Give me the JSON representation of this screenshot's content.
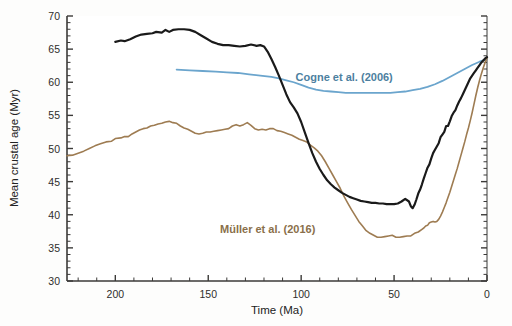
{
  "chart_data": {
    "type": "line",
    "title": "",
    "xlabel": "Time (Ma)",
    "ylabel": "Mean crustal age (Myr)",
    "xlim": [
      226,
      0
    ],
    "ylim": [
      30,
      70
    ],
    "x_reversed": true,
    "grid": false,
    "legend_position": "inline-annotations",
    "xticks": [
      200,
      150,
      100,
      50,
      0
    ],
    "xtick_labels": [
      "200",
      "150",
      "100",
      "50",
      "0"
    ],
    "x_minor_interval": 10,
    "yticks": [
      30,
      35,
      40,
      45,
      50,
      55,
      60,
      65,
      70
    ],
    "ytick_labels": [
      "30",
      "35",
      "40",
      "45",
      "50",
      "55",
      "60",
      "65",
      "70"
    ],
    "y_minor_interval": 1,
    "series": [
      {
        "name": "Seton et al. (2012)",
        "color": "#1a1a1a",
        "width": 2.2,
        "label_color": "#111111",
        "label_x": 148,
        "label_y": 353,
        "points": [
          [
            200,
            66.1
          ],
          [
            197,
            66.3
          ],
          [
            195,
            66.2
          ],
          [
            192,
            66.5
          ],
          [
            189,
            66.9
          ],
          [
            186,
            67.2
          ],
          [
            183,
            67.3
          ],
          [
            180,
            67.4
          ],
          [
            178,
            67.6
          ],
          [
            175,
            67.5
          ],
          [
            173,
            67.9
          ],
          [
            171,
            67.6
          ],
          [
            169,
            67.9
          ],
          [
            166,
            68.0
          ],
          [
            163,
            68.0
          ],
          [
            160,
            67.9
          ],
          [
            157,
            67.6
          ],
          [
            154,
            67.1
          ],
          [
            151,
            66.6
          ],
          [
            148,
            66.1
          ],
          [
            145,
            65.8
          ],
          [
            142,
            65.6
          ],
          [
            139,
            65.6
          ],
          [
            136,
            65.5
          ],
          [
            133,
            65.4
          ],
          [
            130,
            65.5
          ],
          [
            127,
            65.7
          ],
          [
            124,
            65.5
          ],
          [
            122,
            65.6
          ],
          [
            120,
            65.4
          ],
          [
            118,
            64.6
          ],
          [
            116,
            63.5
          ],
          [
            114,
            62.3
          ],
          [
            112,
            61.0
          ],
          [
            110,
            59.6
          ],
          [
            108,
            58.2
          ],
          [
            106,
            57.0
          ],
          [
            104,
            56.2
          ],
          [
            102,
            55.3
          ],
          [
            100,
            54.0
          ],
          [
            98,
            52.4
          ],
          [
            96,
            50.8
          ],
          [
            94,
            49.3
          ],
          [
            92,
            48.0
          ],
          [
            90,
            46.9
          ],
          [
            88,
            46.0
          ],
          [
            86,
            45.2
          ],
          [
            84,
            44.6
          ],
          [
            82,
            44.1
          ],
          [
            80,
            43.7
          ],
          [
            78,
            43.3
          ],
          [
            76,
            43.0
          ],
          [
            74,
            42.7
          ],
          [
            72,
            42.5
          ],
          [
            70,
            42.3
          ],
          [
            68,
            42.1
          ],
          [
            66,
            42.0
          ],
          [
            64,
            41.9
          ],
          [
            62,
            41.8
          ],
          [
            60,
            41.8
          ],
          [
            58,
            41.7
          ],
          [
            56,
            41.7
          ],
          [
            54,
            41.6
          ],
          [
            52,
            41.6
          ],
          [
            50,
            41.6
          ],
          [
            48,
            41.7
          ],
          [
            46,
            42.0
          ],
          [
            44,
            42.4
          ],
          [
            42,
            42.0
          ],
          [
            41,
            41.3
          ],
          [
            40,
            41.0
          ],
          [
            39,
            41.5
          ],
          [
            38,
            42.3
          ],
          [
            37,
            43.2
          ],
          [
            36,
            43.8
          ],
          [
            35,
            44.6
          ],
          [
            34,
            45.5
          ],
          [
            33,
            46.3
          ],
          [
            32,
            47.1
          ],
          [
            31,
            47.6
          ],
          [
            30,
            48.5
          ],
          [
            29,
            49.3
          ],
          [
            28,
            49.8
          ],
          [
            27,
            50.3
          ],
          [
            26,
            50.8
          ],
          [
            25,
            51.7
          ],
          [
            24,
            52.1
          ],
          [
            23,
            52.5
          ],
          [
            22,
            53.4
          ],
          [
            21,
            53.4
          ],
          [
            20,
            54.1
          ],
          [
            19,
            54.9
          ],
          [
            18,
            55.4
          ],
          [
            17,
            55.8
          ],
          [
            16,
            56.5
          ],
          [
            15,
            57.1
          ],
          [
            14,
            57.6
          ],
          [
            13,
            58.2
          ],
          [
            12,
            58.8
          ],
          [
            11,
            59.4
          ],
          [
            10,
            60.0
          ],
          [
            9,
            60.6
          ],
          [
            8,
            61.0
          ],
          [
            7,
            61.4
          ],
          [
            6,
            61.8
          ],
          [
            5,
            62.2
          ],
          [
            4,
            62.6
          ],
          [
            3,
            63.0
          ],
          [
            2,
            63.3
          ],
          [
            1,
            63.6
          ],
          [
            0,
            63.8
          ]
        ]
      },
      {
        "name": "Müller et al. (2016)",
        "color": "#9e7c52",
        "width": 1.6,
        "label_color": "#8a6f4a",
        "label_x": 118,
        "label_y": 37.3,
        "points": [
          [
            226,
            48.9
          ],
          [
            223,
            49.0
          ],
          [
            220,
            49.3
          ],
          [
            217,
            49.6
          ],
          [
            214,
            50.0
          ],
          [
            211,
            50.4
          ],
          [
            208,
            50.7
          ],
          [
            205,
            51.0
          ],
          [
            202,
            51.1
          ],
          [
            200,
            51.5
          ],
          [
            197,
            51.6
          ],
          [
            195,
            51.8
          ],
          [
            193,
            51.8
          ],
          [
            191,
            52.2
          ],
          [
            189,
            52.5
          ],
          [
            187,
            52.8
          ],
          [
            185,
            53.0
          ],
          [
            183,
            53.1
          ],
          [
            181,
            53.4
          ],
          [
            179,
            53.5
          ],
          [
            177,
            53.7
          ],
          [
            175,
            53.8
          ],
          [
            173,
            54.0
          ],
          [
            171,
            54.1
          ],
          [
            169,
            53.9
          ],
          [
            167,
            53.8
          ],
          [
            165,
            53.4
          ],
          [
            163,
            53.1
          ],
          [
            161,
            52.9
          ],
          [
            159,
            52.6
          ],
          [
            157,
            52.3
          ],
          [
            155,
            52.2
          ],
          [
            153,
            52.3
          ],
          [
            151,
            52.5
          ],
          [
            149,
            52.5
          ],
          [
            147,
            52.6
          ],
          [
            145,
            52.7
          ],
          [
            143,
            52.8
          ],
          [
            141,
            52.9
          ],
          [
            139,
            53.0
          ],
          [
            137,
            53.4
          ],
          [
            135,
            53.6
          ],
          [
            133,
            53.4
          ],
          [
            131,
            53.6
          ],
          [
            129,
            53.9
          ],
          [
            127,
            53.5
          ],
          [
            125,
            53.0
          ],
          [
            123,
            52.8
          ],
          [
            121,
            52.9
          ],
          [
            119,
            52.8
          ],
          [
            117,
            53.0
          ],
          [
            115,
            53.0
          ],
          [
            113,
            52.7
          ],
          [
            111,
            52.6
          ],
          [
            109,
            52.4
          ],
          [
            107,
            52.2
          ],
          [
            105,
            52.0
          ],
          [
            103,
            51.7
          ],
          [
            101,
            51.4
          ],
          [
            99,
            51.2
          ],
          [
            97,
            51.0
          ],
          [
            95,
            50.5
          ],
          [
            93,
            50.1
          ],
          [
            91,
            49.6
          ],
          [
            89,
            48.9
          ],
          [
            87,
            48.0
          ],
          [
            85,
            47.0
          ],
          [
            83,
            46.0
          ],
          [
            81,
            45.0
          ],
          [
            79,
            44.0
          ],
          [
            77,
            42.8
          ],
          [
            75,
            41.8
          ],
          [
            73,
            40.8
          ],
          [
            71,
            39.9
          ],
          [
            69,
            39.0
          ],
          [
            67,
            38.3
          ],
          [
            65,
            37.6
          ],
          [
            63,
            37.2
          ],
          [
            61,
            36.9
          ],
          [
            59,
            36.6
          ],
          [
            57,
            36.6
          ],
          [
            55,
            36.7
          ],
          [
            53,
            36.8
          ],
          [
            51,
            36.9
          ],
          [
            49,
            36.6
          ],
          [
            47,
            36.6
          ],
          [
            45,
            36.7
          ],
          [
            43,
            36.8
          ],
          [
            41,
            36.8
          ],
          [
            39,
            37.2
          ],
          [
            37,
            37.4
          ],
          [
            35,
            37.8
          ],
          [
            34,
            38.0
          ],
          [
            33,
            38.3
          ],
          [
            32,
            38.4
          ],
          [
            31,
            38.8
          ],
          [
            30,
            38.9
          ],
          [
            29,
            39.0
          ],
          [
            28,
            38.9
          ],
          [
            27,
            39.0
          ],
          [
            26,
            39.3
          ],
          [
            25,
            39.8
          ],
          [
            24,
            40.4
          ],
          [
            23,
            41.1
          ],
          [
            22,
            41.8
          ],
          [
            21,
            42.6
          ],
          [
            20,
            43.4
          ],
          [
            19,
            44.3
          ],
          [
            18,
            45.2
          ],
          [
            17,
            46.1
          ],
          [
            16,
            47.0
          ],
          [
            15,
            48.0
          ],
          [
            14,
            49.0
          ],
          [
            13,
            50.0
          ],
          [
            12,
            51.0
          ],
          [
            11,
            52.1
          ],
          [
            10,
            53.1
          ],
          [
            9,
            54.2
          ],
          [
            8,
            55.4
          ],
          [
            7,
            56.7
          ],
          [
            6,
            58.0
          ],
          [
            5,
            59.2
          ],
          [
            4,
            60.3
          ],
          [
            3,
            61.3
          ],
          [
            2,
            62.2
          ],
          [
            1,
            63.0
          ],
          [
            0,
            63.6
          ]
        ]
      },
      {
        "name": "Cogne et al. (2006)",
        "color": "#6ba5cd",
        "width": 1.8,
        "label_color": "#4d7fa0",
        "label_x": 103,
        "label_y": 60.2,
        "points": [
          [
            167,
            61.9
          ],
          [
            160,
            61.8
          ],
          [
            153,
            61.7
          ],
          [
            146,
            61.6
          ],
          [
            140,
            61.5
          ],
          [
            134,
            61.4
          ],
          [
            128,
            61.2
          ],
          [
            122,
            61.0
          ],
          [
            116,
            60.8
          ],
          [
            112,
            60.6
          ],
          [
            108,
            60.3
          ],
          [
            104,
            60.0
          ],
          [
            100,
            59.6
          ],
          [
            96,
            59.2
          ],
          [
            92,
            58.9
          ],
          [
            88,
            58.7
          ],
          [
            84,
            58.6
          ],
          [
            80,
            58.5
          ],
          [
            76,
            58.4
          ],
          [
            72,
            58.4
          ],
          [
            68,
            58.4
          ],
          [
            64,
            58.4
          ],
          [
            60,
            58.4
          ],
          [
            56,
            58.4
          ],
          [
            52,
            58.4
          ],
          [
            48,
            58.5
          ],
          [
            44,
            58.6
          ],
          [
            40,
            58.8
          ],
          [
            36,
            59.0
          ],
          [
            32,
            59.3
          ],
          [
            28,
            59.7
          ],
          [
            24,
            60.2
          ],
          [
            20,
            60.8
          ],
          [
            16,
            61.4
          ],
          [
            12,
            62.0
          ],
          [
            8,
            62.6
          ],
          [
            4,
            63.1
          ],
          [
            0,
            63.5
          ]
        ]
      }
    ]
  },
  "labels": {
    "seton": "Seton et al. (2012)",
    "muller": "Müller et al. (2016)",
    "cogne": "Cogne et al. (2006)"
  },
  "axes": {
    "x_title": "Time (Ma)",
    "y_title": "Mean crustal age (Myr)",
    "x_ticks": [
      "200",
      "150",
      "100",
      "50",
      "0"
    ],
    "y_ticks": [
      "70",
      "65",
      "60",
      "55",
      "50",
      "45",
      "40",
      "35",
      "30"
    ]
  }
}
